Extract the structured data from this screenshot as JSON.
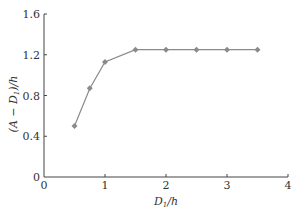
{
  "chart_data": {
    "type": "line",
    "title": "",
    "xlabel": "D1/h",
    "ylabel": "(A − D1)/h",
    "xlim": [
      0,
      4
    ],
    "ylim": [
      0,
      1.6
    ],
    "xticks": [
      0,
      1,
      2,
      3,
      4
    ],
    "yticks": [
      0,
      0.4,
      0.8,
      1.2,
      1.6
    ],
    "xtick_labels": [
      "0",
      "1",
      "2",
      "3",
      "4"
    ],
    "ytick_labels": [
      "0",
      "0.4",
      "0.8",
      "1.2",
      "1.6"
    ],
    "grid": false,
    "legend": null,
    "series": [
      {
        "name": "(A − D1)/h",
        "marker": "diamond",
        "color": "#8a8a8a",
        "x": [
          0.5,
          0.75,
          1.0,
          1.5,
          2.0,
          2.5,
          3.0,
          3.5
        ],
        "values": [
          0.5,
          0.87,
          1.13,
          1.25,
          1.25,
          1.25,
          1.25,
          1.25
        ]
      }
    ]
  },
  "labels": {
    "x_axis_main": "D",
    "x_axis_sub": "1",
    "x_axis_rest": "/h",
    "y_axis_pre": "(A − D",
    "y_axis_sub": "1",
    "y_axis_rest": ")/h"
  }
}
